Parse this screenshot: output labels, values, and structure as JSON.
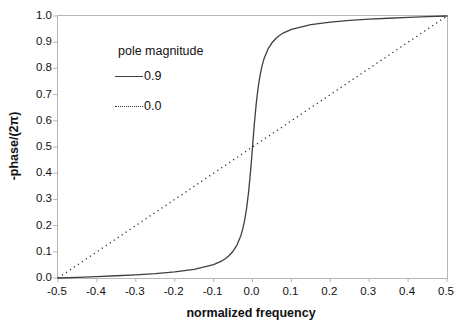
{
  "figure": {
    "background": "#ffffff",
    "frame_color": "#b6b6b6",
    "tick_color": "#b6b6b6",
    "text_color": "#111111"
  },
  "axes": {
    "xlabel": "normalized frequency",
    "ylabel": "-phase/(2π)"
  },
  "legend": {
    "title": "pole magnitude",
    "entries": [
      {
        "label": "0.9",
        "style": "solid"
      },
      {
        "label": "0.0",
        "style": "dotted"
      }
    ]
  },
  "chart_data": {
    "type": "line",
    "title": "",
    "xlabel": "normalized frequency",
    "ylabel": "-phase/(2π)",
    "xlim": [
      -0.5,
      0.5
    ],
    "ylim": [
      0.0,
      1.0
    ],
    "grid": false,
    "legend_title": "pole magnitude",
    "legend_position": "upper-left-inside",
    "xticks": [
      -0.5,
      -0.4,
      -0.3,
      -0.2,
      -0.1,
      0.0,
      0.1,
      0.2,
      0.3,
      0.4,
      0.5
    ],
    "xtick_labels": [
      "-0.5",
      "-0.4",
      "-0.3",
      "-0.2",
      "-0.1",
      "0.0",
      "0.1",
      "0.2",
      "0.3",
      "0.4",
      "0.5"
    ],
    "yticks": [
      0.0,
      0.1,
      0.2,
      0.3,
      0.4,
      0.5,
      0.6,
      0.7,
      0.8,
      0.9,
      1.0
    ],
    "ytick_labels": [
      "0.0",
      "0.1",
      "0.2",
      "0.3",
      "0.4",
      "0.5",
      "0.6",
      "0.7",
      "0.8",
      "0.9",
      "1.0"
    ],
    "series": [
      {
        "name": "0.9",
        "line_style": "solid",
        "color": "#3f3f3f",
        "points": [
          [
            -0.5,
            0.0
          ],
          [
            -0.45,
            0.0027
          ],
          [
            -0.4,
            0.0055
          ],
          [
            -0.35,
            0.0086
          ],
          [
            -0.3,
            0.0121
          ],
          [
            -0.25,
            0.0167
          ],
          [
            -0.2,
            0.023
          ],
          [
            -0.15,
            0.0329
          ],
          [
            -0.1,
            0.0512
          ],
          [
            -0.08,
            0.0642
          ],
          [
            -0.07,
            0.0734
          ],
          [
            -0.06,
            0.0857
          ],
          [
            -0.05,
            0.1022
          ],
          [
            -0.04,
            0.1258
          ],
          [
            -0.03,
            0.1617
          ],
          [
            -0.025,
            0.1876
          ],
          [
            -0.02,
            0.2219
          ],
          [
            -0.015,
            0.2674
          ],
          [
            -0.01,
            0.3287
          ],
          [
            -0.005,
            0.4077
          ],
          [
            -0.0025,
            0.4528
          ],
          [
            0.0,
            0.5
          ],
          [
            0.0025,
            0.5472
          ],
          [
            0.005,
            0.5923
          ],
          [
            0.01,
            0.6713
          ],
          [
            0.015,
            0.7326
          ],
          [
            0.02,
            0.7781
          ],
          [
            0.025,
            0.8124
          ],
          [
            0.03,
            0.8383
          ],
          [
            0.04,
            0.8742
          ],
          [
            0.05,
            0.8978
          ],
          [
            0.06,
            0.9143
          ],
          [
            0.07,
            0.9266
          ],
          [
            0.08,
            0.9358
          ],
          [
            0.1,
            0.9488
          ],
          [
            0.15,
            0.9671
          ],
          [
            0.2,
            0.977
          ],
          [
            0.25,
            0.9833
          ],
          [
            0.3,
            0.9879
          ],
          [
            0.35,
            0.9914
          ],
          [
            0.4,
            0.9946
          ],
          [
            0.45,
            0.9973
          ],
          [
            0.5,
            1.0
          ]
        ]
      },
      {
        "name": "0.0",
        "line_style": "dotted",
        "color": "#2e2e2e",
        "points": [
          [
            -0.5,
            0.0
          ],
          [
            0.5,
            1.0
          ]
        ]
      }
    ]
  }
}
